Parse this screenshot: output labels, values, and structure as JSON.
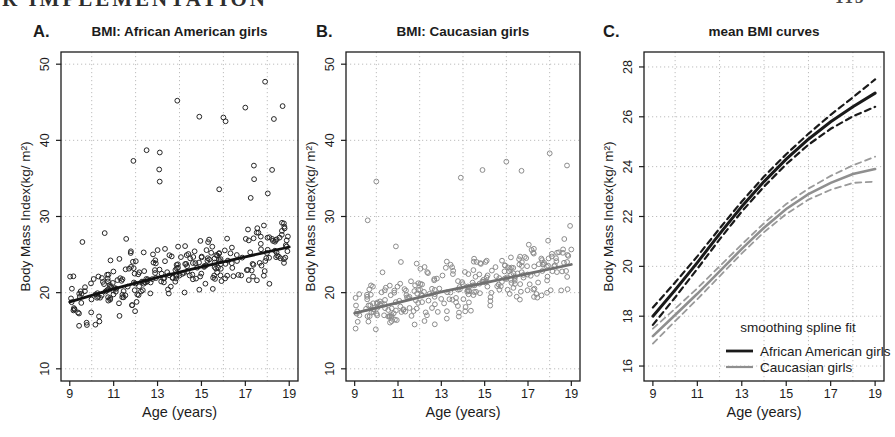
{
  "page": {
    "header_left": "R IMPLEMENTATION",
    "header_right": "113"
  },
  "chart_data": [
    {
      "type": "scatter",
      "panel_label": "A.",
      "title": "BMI: African American girls",
      "xlabel": "Age (years)",
      "ylabel": "Body Mass Index(kg/ m²)",
      "xlim": [
        8.6,
        19.4
      ],
      "ylim": [
        8.4,
        51.6
      ],
      "xticks": [
        9,
        11,
        13,
        15,
        17,
        19
      ],
      "yticks": [
        10,
        20,
        30,
        40,
        50
      ],
      "grid_x": [
        10,
        12,
        14,
        16,
        18
      ],
      "grid_y": [
        10,
        20,
        30,
        40,
        50
      ],
      "grid_on": true,
      "point_color": "#262626",
      "trend_color": "#111111",
      "trend": {
        "x": [
          9,
          11,
          13,
          15,
          17,
          19
        ],
        "y": [
          18.8,
          20.5,
          22.0,
          23.4,
          24.7,
          26.0
        ]
      },
      "scatter": {
        "n": 290,
        "seed": 42,
        "x_range": [
          9,
          19
        ],
        "spread": 4.4,
        "tail_p": 0.09,
        "tail_amp": 17,
        "y_clip": [
          14.2,
          48.2
        ]
      },
      "outliers": [
        [
          13.9,
          45.2
        ],
        [
          17.9,
          47.7
        ],
        [
          18.7,
          44.5
        ],
        [
          17.0,
          44.3
        ],
        [
          14.9,
          43.1
        ],
        [
          16.0,
          43.0
        ],
        [
          18.3,
          42.8
        ],
        [
          16.1,
          42.5
        ],
        [
          13.1,
          38.4
        ],
        [
          12.5,
          38.7
        ],
        [
          11.9,
          37.3
        ]
      ],
      "layout": {
        "box": {
          "l": 61,
          "t": 52,
          "r": 298,
          "b": 381
        },
        "label_x": 33
      }
    },
    {
      "type": "scatter",
      "panel_label": "B.",
      "title": "BMI: Caucasian girls",
      "xlabel": "Age (years)",
      "ylabel": "Body Mass Index(kg/ m²)",
      "xlim": [
        8.6,
        19.4
      ],
      "ylim": [
        8.4,
        51.6
      ],
      "xticks": [
        9,
        11,
        13,
        15,
        17,
        19
      ],
      "yticks": [
        10,
        20,
        30,
        40,
        50
      ],
      "grid_x": [
        10,
        12,
        14,
        16,
        18
      ],
      "grid_y": [
        10,
        20,
        30,
        40,
        50
      ],
      "grid_on": true,
      "point_color": "#8c8c8c",
      "trend_color": "#707070",
      "trend": {
        "x": [
          9,
          11,
          13,
          15,
          17,
          19
        ],
        "y": [
          17.3,
          18.7,
          20.1,
          21.3,
          22.5,
          23.7
        ]
      },
      "scatter": {
        "n": 295,
        "seed": 7,
        "x_range": [
          9,
          19
        ],
        "spread": 4.1,
        "tail_p": 0.08,
        "tail_amp": 12,
        "y_clip": [
          12.8,
          38.4
        ]
      },
      "outliers": [
        [
          18.0,
          38.3
        ],
        [
          16.0,
          37.2
        ],
        [
          18.8,
          36.7
        ],
        [
          16.7,
          36.0
        ],
        [
          14.9,
          36.1
        ],
        [
          13.9,
          35.1
        ],
        [
          10.0,
          34.6
        ],
        [
          9.6,
          29.5
        ]
      ],
      "layout": {
        "box": {
          "l": 346,
          "t": 52,
          "r": 580,
          "b": 381
        },
        "label_x": 316
      }
    },
    {
      "type": "line",
      "panel_label": "C.",
      "title": "mean BMI curves",
      "xlabel": "Age (years)",
      "ylabel": "Body Mass Index(kg/ m²)",
      "xlim": [
        8.6,
        19.4
      ],
      "ylim": [
        15.4,
        28.6
      ],
      "xticks": [
        9,
        11,
        13,
        15,
        17,
        19
      ],
      "yticks": [
        16,
        18,
        20,
        22,
        24,
        26,
        28
      ],
      "grid_x": [
        10,
        12,
        14,
        16,
        18
      ],
      "grid_y": [
        16,
        18,
        20,
        22,
        24,
        26,
        28
      ],
      "grid_on": true,
      "x": [
        9,
        10,
        11,
        12,
        13,
        14,
        15,
        16,
        17,
        18,
        19
      ],
      "series": [
        {
          "name": "African American girls upper CI",
          "values": [
            18.35,
            19.35,
            20.4,
            21.52,
            22.6,
            23.6,
            24.5,
            25.32,
            26.08,
            26.78,
            27.5
          ],
          "color": "#1a1a1a",
          "style": "dashed",
          "width": 2.2
        },
        {
          "name": "African American girls lower CI",
          "values": [
            17.65,
            18.75,
            19.9,
            21.08,
            22.2,
            23.2,
            24.1,
            24.88,
            25.52,
            26.02,
            26.4
          ],
          "color": "#1a1a1a",
          "style": "dashed",
          "width": 2.2
        },
        {
          "name": "African American girls mean",
          "values": [
            18.0,
            19.05,
            20.15,
            21.3,
            22.4,
            23.4,
            24.3,
            25.1,
            25.8,
            26.4,
            26.95
          ],
          "color": "#1a1a1a",
          "style": "solid",
          "width": 3.0
        },
        {
          "name": "Caucasian girls upper CI",
          "values": [
            17.5,
            18.3,
            19.12,
            20.0,
            20.88,
            21.73,
            22.5,
            23.12,
            23.63,
            24.05,
            24.4
          ],
          "color": "#9a9a9a",
          "style": "dashed",
          "width": 1.8
        },
        {
          "name": "Caucasian girls lower CI",
          "values": [
            16.9,
            17.8,
            18.68,
            19.6,
            20.52,
            21.37,
            22.1,
            22.68,
            23.07,
            23.35,
            23.4
          ],
          "color": "#9a9a9a",
          "style": "dashed",
          "width": 1.8
        },
        {
          "name": "Caucasian girls mean",
          "values": [
            17.2,
            18.05,
            18.9,
            19.8,
            20.7,
            21.55,
            22.3,
            22.9,
            23.35,
            23.7,
            23.9
          ],
          "color": "#8f8f8f",
          "style": "solid",
          "width": 2.6
        }
      ],
      "legend": {
        "title": "smoothing spline fit",
        "entries": [
          {
            "label": "African American girls",
            "color": "#1a1a1a"
          },
          {
            "label": "Caucasian girls",
            "color": "#8f8f8f"
          }
        ],
        "position": "bottom-right"
      },
      "layout": {
        "box": {
          "l": 644,
          "t": 52,
          "r": 884,
          "b": 381
        },
        "label_x": 603,
        "legend": {
          "x": 726,
          "y": 332
        }
      }
    }
  ]
}
